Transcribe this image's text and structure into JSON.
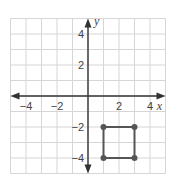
{
  "chart_data": {
    "type": "scatter",
    "title": "",
    "xlabel": "x",
    "ylabel": "y",
    "xlim": [
      -5,
      5
    ],
    "ylim": [
      -5,
      5
    ],
    "grid": true,
    "x_tick_labels": [
      {
        "value": -4,
        "label": "−4"
      },
      {
        "value": -2,
        "label": "−2"
      },
      {
        "value": 2,
        "label": "2"
      },
      {
        "value": 4,
        "label": "4"
      }
    ],
    "y_tick_labels": [
      {
        "value": 4,
        "label": "4"
      },
      {
        "value": 2,
        "label": "2"
      },
      {
        "value": -2,
        "label": "−2"
      },
      {
        "value": -4,
        "label": "−4"
      }
    ],
    "shapes": [
      {
        "name": "square",
        "vertices": [
          [
            1,
            -2
          ],
          [
            3,
            -2
          ],
          [
            3,
            -4
          ],
          [
            1,
            -4
          ]
        ]
      }
    ]
  },
  "axes": {
    "x_label": "x",
    "y_label": "y"
  },
  "colors": {
    "grid": "#d6d6d6",
    "axis": "#333333",
    "shape": "#555555"
  }
}
